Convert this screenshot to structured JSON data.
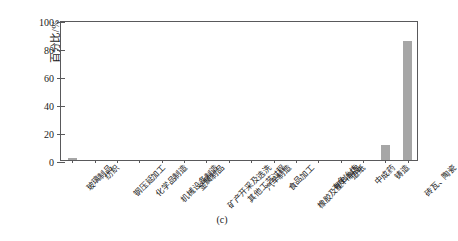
{
  "figure": {
    "caption": "(c)",
    "ylabel": "百分比/%"
  },
  "chart_data": {
    "type": "bar",
    "title": "",
    "xlabel": "",
    "ylabel": "百分比/%",
    "ylim": [
      0,
      100
    ],
    "yticks": [
      0,
      20,
      40,
      60,
      80,
      100
    ],
    "grid": false,
    "legend": null,
    "bar_color": "#a6a6a6",
    "axis_color": "#59595b",
    "categories": [
      "玻璃制品",
      "纺织",
      "钢压延加工",
      "化学品制造",
      "机械设备制造",
      "金属制品",
      "矿产开采及选洗",
      "其他工艺过程",
      "汽车制造",
      "食品加工",
      "橡胶及塑料制品",
      "有色冶炼",
      "造纸",
      "中成药",
      "铸造",
      "砖瓦、陶瓷"
    ],
    "values": [
      1.5,
      0,
      0,
      0,
      0,
      0,
      0,
      0,
      0,
      0,
      0,
      0,
      0,
      0,
      11,
      85
    ]
  }
}
